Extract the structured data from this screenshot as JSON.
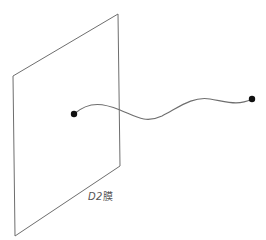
{
  "diagram": {
    "brane": {
      "label_prefix": "D2",
      "label_suffix": "膜",
      "corners": {
        "top_left": [
          13,
          76
        ],
        "top_right": [
          118,
          14
        ],
        "bottom_right": [
          120,
          166
        ],
        "bottom_left": [
          15,
          236
        ]
      },
      "stroke_color": "#6e6e6e"
    },
    "string": {
      "start_point": [
        74,
        114
      ],
      "end_point": [
        252,
        99
      ],
      "stroke_color": "#6e6e6e",
      "endpoint_color": "#111111"
    }
  }
}
